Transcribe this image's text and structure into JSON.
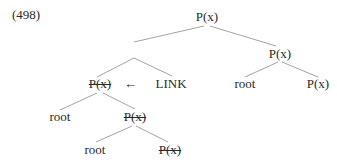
{
  "example_number": "(498)",
  "nodes": {
    "root": "P(x)",
    "right_p": "P(x)",
    "left_struck_p": "P(x)",
    "link": "LINK",
    "right_root": "root",
    "right_p_leaf": "P(x)",
    "left_root": "root",
    "mid_struck_p": "P(x)",
    "bottom_root": "root",
    "bottom_struck_p": "P(x)"
  },
  "arrow_glyph": "←",
  "colors": {
    "line": "#8a8a8a",
    "text": "#2a2a2a"
  }
}
